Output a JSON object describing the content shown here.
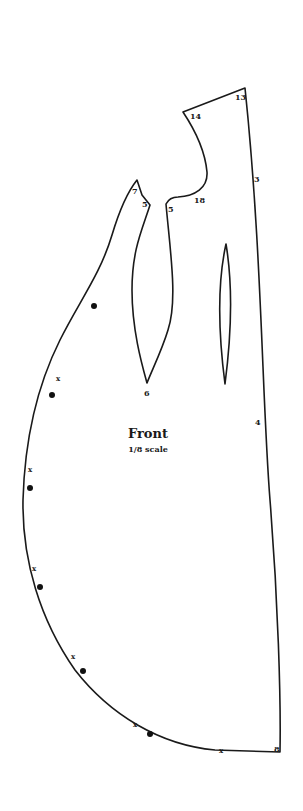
{
  "pattern": {
    "title": "Front",
    "scale": "1/8 scale",
    "point_labels": {
      "p13": "13",
      "p14": "14",
      "p3": "3",
      "p18": "18",
      "p7": "7",
      "p5a": "5",
      "p5b": "5",
      "p6": "6",
      "p4": "4",
      "p8": "8"
    },
    "notch_marks": [
      "x",
      "x",
      "x",
      "x",
      "x",
      "x"
    ],
    "colors": {
      "line": "#1a1a1a",
      "background": "#ffffff"
    }
  }
}
